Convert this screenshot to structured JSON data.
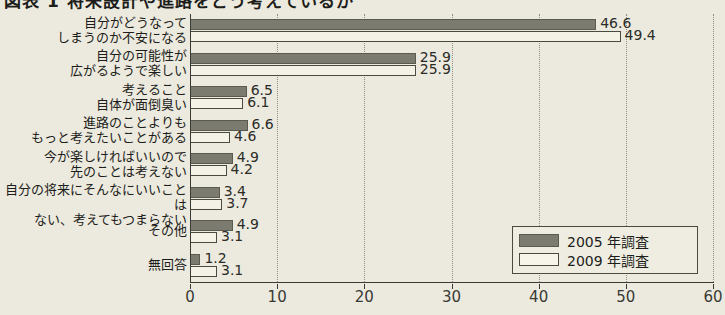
{
  "title": "図表 1  将来設計や進路をどう考えているか",
  "chart_data": {
    "type": "bar",
    "orientation": "horizontal",
    "title": "図表 1  将来設計や進路をどう考えているか",
    "xlabel": "",
    "ylabel": "",
    "xunit": "(%)",
    "xlim": [
      0,
      60
    ],
    "xticks": [
      0,
      10,
      20,
      30,
      40,
      50,
      60
    ],
    "xtick_labels": [
      "0",
      "10",
      "20",
      "30",
      "40",
      "50",
      "60"
    ],
    "grid": "vertical-dotted",
    "legend_position": "bottom-right",
    "categories": [
      "自分がどうなって\nしまうのか不安になる",
      "自分の可能性が\n広がるようで楽しい",
      "考えること\n自体が面倒臭い",
      "進路のことよりも\nもっと考えたいことがある",
      "今が楽しければいいので\n先のことは考えない",
      "自分の将来にそんなにいいことは\nない、考えてもつまらない",
      "その他",
      "無回答"
    ],
    "series": [
      {
        "name": "2005 年調査",
        "color": "#7b7b70",
        "values": [
          46.6,
          25.9,
          6.5,
          6.6,
          4.9,
          3.4,
          4.9,
          1.2
        ],
        "labels": [
          "46.6",
          "25.9",
          "6.5",
          "6.6",
          "4.9",
          "3.4",
          "4.9",
          "1.2"
        ]
      },
      {
        "name": "2009 年調査",
        "color": "#f4f2e6",
        "values": [
          49.4,
          25.9,
          6.1,
          4.6,
          4.2,
          3.7,
          3.1,
          3.1
        ],
        "labels": [
          "49.4",
          "25.9",
          "6.1",
          "4.6",
          "4.2",
          "3.7",
          "3.1",
          "3.1"
        ]
      }
    ]
  },
  "legend": {
    "items": [
      {
        "label": "2005 年調査"
      },
      {
        "label": "2009 年調査"
      }
    ]
  }
}
